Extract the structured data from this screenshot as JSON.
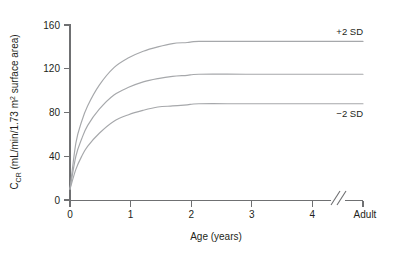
{
  "chart_data": {
    "type": "line",
    "title": "",
    "xlabel": "Age (years)",
    "ylabel": "C_CR (mL/min/1.73 m2 surface area)",
    "ylabel_parts": {
      "main": "C",
      "subscript": "CR",
      "rest_before_sup": " (mL/min/1.73 m",
      "superscript": "2",
      "rest_after_sup": " surface area)"
    },
    "x": [
      0,
      0.1,
      0.2,
      0.3,
      0.5,
      0.75,
      1.0,
      1.25,
      1.5,
      1.75,
      2.0,
      2.2,
      3.0,
      4.0,
      5.0
    ],
    "xlim": [
      0,
      5
    ],
    "ylim": [
      0,
      160
    ],
    "yticks": [
      0,
      40,
      80,
      120,
      160
    ],
    "ytick_labels": [
      "0",
      "40",
      "80",
      "120",
      "160"
    ],
    "xticks": [
      0,
      1,
      2,
      3,
      4,
      5
    ],
    "xtick_labels": [
      "0",
      "1",
      "2",
      "3",
      "4",
      "Adult"
    ],
    "axis_break": {
      "present": true,
      "symbol": "//",
      "position_x": 4.45,
      "note": "axis break between 4 years and Adult"
    },
    "grid": false,
    "legend_position": "inline-right",
    "curve_color": "#a6a8ab",
    "axis_color": "#6f7072",
    "text_color": "#231f20",
    "series": [
      {
        "name": "+2 SD",
        "label": "+2 SD",
        "plateau": 145,
        "values": [
          10,
          52,
          72,
          86,
          105,
          121,
          130,
          136,
          140,
          143,
          144,
          145,
          145,
          145,
          145
        ]
      },
      {
        "name": "Mean",
        "label": "",
        "plateau": 115,
        "values": [
          10,
          40,
          56,
          68,
          83,
          96,
          103,
          108,
          111,
          113,
          114,
          115,
          115,
          115,
          115
        ]
      },
      {
        "name": "-2 SD",
        "label": "−2 SD",
        "plateau": 88,
        "values": [
          10,
          28,
          40,
          49,
          61,
          72,
          78,
          82,
          85,
          86,
          87,
          88,
          88,
          88,
          88
        ]
      }
    ],
    "annotations": [
      {
        "text": "+2 SD",
        "x": 4.55,
        "y": 153
      },
      {
        "text": "−2 SD",
        "x": 4.55,
        "y": 76
      }
    ]
  }
}
